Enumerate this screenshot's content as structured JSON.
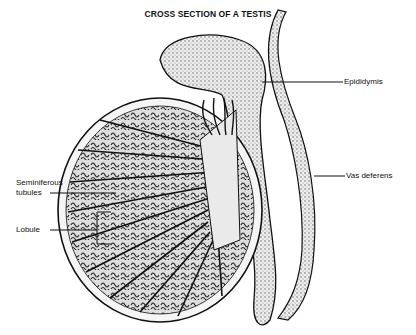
{
  "title": "CROSS SECTION OF A TESTIS",
  "labels": {
    "epididymis": "Epididymis",
    "vas_deferens": "Vas deferens",
    "seminiferous_line1": "Seminiferous",
    "seminiferous_line2": "tubules",
    "lobule": "Lobule"
  },
  "colors": {
    "ink": "#111111",
    "paper": "#ffffff",
    "stipple": "#bdbdbd"
  }
}
